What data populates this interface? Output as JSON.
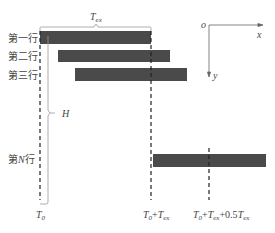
{
  "diagram": {
    "title_label": {
      "main": "T",
      "sub": "ex"
    },
    "rows": [
      {
        "label": "第一行",
        "x": 40,
        "y": 31,
        "w": 111,
        "h": 13
      },
      {
        "label": "第二行",
        "x": 58,
        "y": 50,
        "w": 112,
        "h": 12
      },
      {
        "label": "第三行",
        "x": 75,
        "y": 68,
        "w": 112,
        "h": 13
      },
      {
        "label_pre": "第",
        "label_var": "N",
        "label_post": "行",
        "x": 153,
        "y": 154,
        "w": 113,
        "h": 13
      }
    ],
    "height_label": "H",
    "axis": {
      "origin": "o",
      "x_label": "x",
      "y_label": "y"
    },
    "time_labels": {
      "t0": {
        "main": "T",
        "sub": "0"
      },
      "t1": {
        "a": "T",
        "a_sub": "0",
        "plus": "+",
        "b": "T",
        "b_sub": "ex"
      },
      "t2": {
        "a": "T",
        "a_sub": "0",
        "plus1": "+",
        "b": "T",
        "b_sub": "ex",
        "plus2": "+0.5",
        "c": "T",
        "c_sub": "ex"
      }
    },
    "colors": {
      "bar": "#4a4a4a",
      "line": "#333333",
      "bracket": "#888888"
    }
  }
}
